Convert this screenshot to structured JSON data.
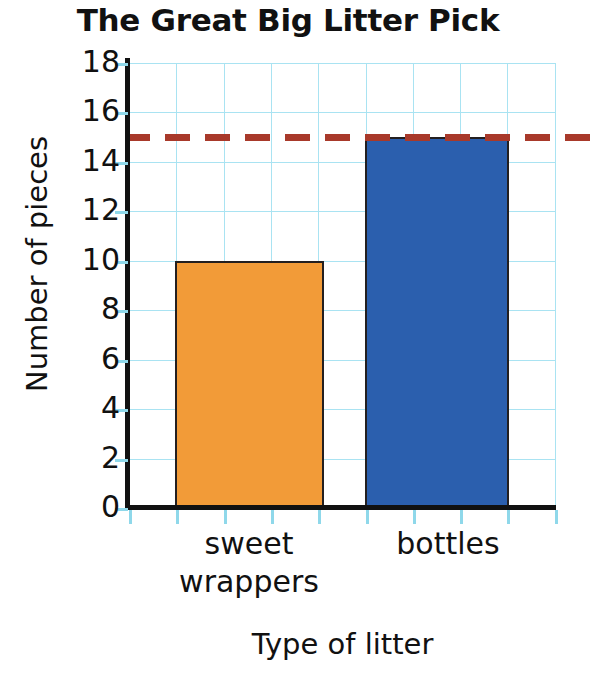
{
  "chart_data": {
    "type": "bar",
    "title": "The Great Big Litter Pick",
    "xlabel": "Type of litter",
    "ylabel": "Number of pieces",
    "categories": [
      "sweet wrappers",
      "bottles"
    ],
    "category_lines": [
      [
        "sweet",
        "wrappers"
      ],
      [
        "bottles"
      ]
    ],
    "values": [
      10,
      15
    ],
    "bar_colors": [
      "#f29b38",
      "#2b5fae"
    ],
    "bar_edge_color": "#231f20",
    "ylim": [
      0,
      18
    ],
    "y_ticks": [
      0,
      2,
      4,
      6,
      8,
      10,
      12,
      14,
      16,
      18
    ],
    "y_tick_labels": [
      "0",
      "2",
      "4",
      "6",
      "8",
      "10",
      "12",
      "14",
      "16",
      "18"
    ],
    "grid": true,
    "grid_color": "#a9e3f2",
    "axis_color": "#111111",
    "legend": null,
    "annotations": [
      {
        "type": "reference-line",
        "style": "dashed",
        "orientation": "horizontal",
        "value": 15,
        "color": "#a8392a"
      }
    ]
  },
  "chart": {
    "title": "The Great Big Litter Pick",
    "x_axis_title": "Type of litter",
    "y_axis_title": "Number of pieces"
  }
}
